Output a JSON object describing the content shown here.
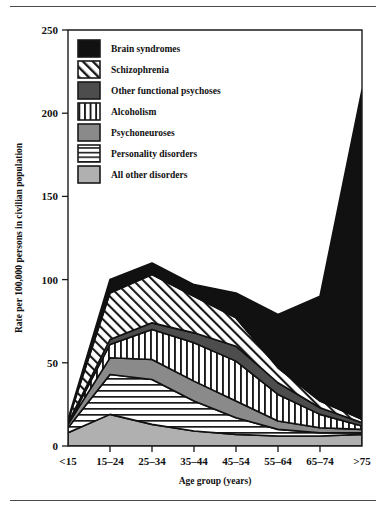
{
  "figure": {
    "background": "#ffffff",
    "frame_color": "#1a1a1a",
    "rule_color": "#4a4a4a"
  },
  "chart_data": {
    "type": "area",
    "stacked": true,
    "title": "",
    "subtitle": "",
    "xlabel": "Age group (years)",
    "ylabel": "Rate per 100,000 persons in civilian population",
    "categories": [
      "<15",
      "15–24",
      "25–34",
      "35–44",
      "45–54",
      "55–64",
      "65–74",
      ">75"
    ],
    "xtick_labels": [
      "<15",
      "15–24",
      "25–34",
      "35–44",
      "45–54",
      "55–64",
      "65–74",
      ">75"
    ],
    "ytick_labels": [
      "0",
      "50",
      "100",
      "150",
      "200",
      "250"
    ],
    "yticks": [
      0,
      50,
      100,
      150,
      200,
      250
    ],
    "ylim": [
      0,
      250
    ],
    "grid": false,
    "legend_position": "upper-left-inside",
    "series": [
      {
        "name": "All other disorders",
        "pattern": "solid-light-gray",
        "color": "#b0b0b0",
        "values": [
          8,
          19,
          13,
          9,
          7,
          6,
          6,
          7
        ]
      },
      {
        "name": "Personality disorders",
        "pattern": "horizontal-lines",
        "color": "#ffffff",
        "values": [
          3,
          24,
          27,
          18,
          10,
          4,
          2,
          1
        ]
      },
      {
        "name": "Psychoneuroses",
        "pattern": "solid-mid-gray",
        "color": "#8a8a8a",
        "values": [
          2,
          10,
          12,
          12,
          10,
          5,
          3,
          2
        ]
      },
      {
        "name": "Alcoholism",
        "pattern": "vertical-lines",
        "color": "#ffffff",
        "values": [
          0,
          8,
          18,
          23,
          24,
          16,
          8,
          2
        ]
      },
      {
        "name": "Other functional psychoses",
        "pattern": "solid-dark-gray",
        "color": "#4d4d4d",
        "values": [
          1,
          3,
          4,
          6,
          9,
          7,
          4,
          2
        ]
      },
      {
        "name": "Schizophrenia",
        "pattern": "diagonal-lines",
        "color": "#ffffff",
        "values": [
          1,
          28,
          29,
          22,
          17,
          9,
          4,
          2
        ]
      },
      {
        "name": "Brain syndromes",
        "pattern": "solid-black",
        "color": "#111111",
        "values": [
          1,
          8,
          7,
          7,
          15,
          32,
          63,
          198
        ]
      }
    ],
    "totals": [
      16,
      100,
      110,
      97,
      92,
      79,
      90,
      214
    ],
    "peak": {
      "category": ">75",
      "value": 214
    },
    "annotations": []
  },
  "legend": {
    "items": [
      {
        "label": "Brain syndromes",
        "swatch": "solid-black"
      },
      {
        "label": "Schizophrenia",
        "swatch": "diagonal-lines"
      },
      {
        "label": "Other functional psychoses",
        "swatch": "solid-dark-gray"
      },
      {
        "label": "Alcoholism",
        "swatch": "vertical-lines"
      },
      {
        "label": "Psychoneuroses",
        "swatch": "solid-mid-gray"
      },
      {
        "label": "Personality disorders",
        "swatch": "horizontal-lines"
      },
      {
        "label": "All other disorders",
        "swatch": "solid-light-gray"
      }
    ]
  }
}
